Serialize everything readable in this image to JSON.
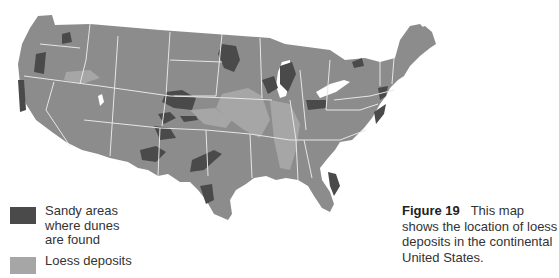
{
  "legend": {
    "items": [
      {
        "label": "Sandy areas where dunes are found",
        "color": "#4a4a4a"
      },
      {
        "label": "Loess deposits",
        "color": "#a6a6a6"
      }
    ]
  },
  "caption": {
    "figure_label": "Figure 19",
    "text": "This map shows the location of loess deposits in the continental United States."
  },
  "map": {
    "land_color": "#8c8c8c",
    "border_color": "#e6e6e6",
    "region": "Continental United States"
  }
}
